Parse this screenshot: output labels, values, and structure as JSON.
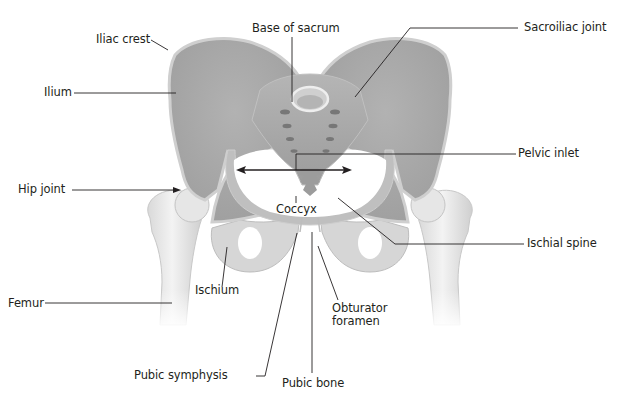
{
  "diagram": {
    "colors": {
      "bone_dark": "#a8a8a8",
      "bone_mid": "#c4c4c4",
      "bone_light": "#e2e2e2",
      "bone_highlight": "#f0f0f0",
      "leader_line": "#231f20",
      "label_text": "#231f20",
      "background": "#ffffff"
    },
    "labels": {
      "iliac_crest": "Iliac crest",
      "base_of_sacrum": "Base of sacrum",
      "sacroiliac_joint": "Sacroiliac joint",
      "ilium": "Ilium",
      "pelvic_inlet": "Pelvic inlet",
      "hip_joint": "Hip joint",
      "coccyx": "Coccyx",
      "ischial_spine": "Ischial spine",
      "ischium": "Ischium",
      "femur": "Femur",
      "obturator_foramen_line1": "Obturator",
      "obturator_foramen_line2": "foramen",
      "pubic_symphysis": "Pubic symphysis",
      "pubic_bone": "Pubic bone"
    }
  }
}
